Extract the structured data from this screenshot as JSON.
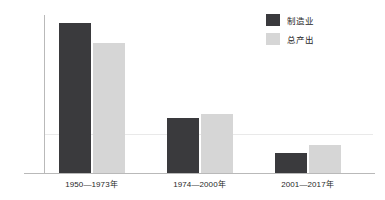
{
  "chart_data": {
    "type": "bar",
    "title": "",
    "subtitle": "",
    "xlabel": "",
    "ylabel": "年均增长率 (%)",
    "categories": [
      "1950—1973年",
      "1974—2000年",
      "2001—2017年"
    ],
    "series": [
      {
        "name": "制造业",
        "color": "#3a3a3d",
        "values": [
          3.8,
          1.4,
          0.5
        ]
      },
      {
        "name": "总产出",
        "color": "#d6d6d6",
        "values": [
          3.3,
          1.5,
          0.7
        ]
      }
    ],
    "ylim": [
      0,
      4.0
    ],
    "yticks": [],
    "ytick_labels": [],
    "grid": true,
    "gridlines": [
      1.0
    ],
    "legend_position": "top-right",
    "annotations": []
  },
  "legend": {
    "items": [
      {
        "label": "制造业",
        "color": "#3a3a3d"
      },
      {
        "label": "总产出",
        "color": "#d6d6d6"
      }
    ]
  },
  "axes": {
    "y_label": "年均增长率 (%)",
    "x_tick_labels": [
      "1950—1973年",
      "1974—2000年",
      "2001—2017年"
    ]
  },
  "colors": {
    "series_dark": "#3a3a3d",
    "series_light": "#d6d6d6",
    "axis_line": "#b9b9b9",
    "gridline": "#e9e9e9",
    "text": "#1f1f1f",
    "background": "#ffffff"
  }
}
